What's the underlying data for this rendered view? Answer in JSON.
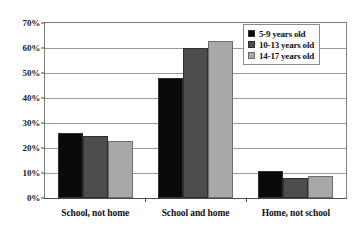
{
  "chart_data": {
    "type": "bar",
    "title": "",
    "xlabel": "",
    "ylabel": "",
    "categories": [
      "School, not home",
      "School and home",
      "Home, not school"
    ],
    "series": [
      {
        "name": "5-9 years old",
        "color": "#0a0a0a",
        "values": [
          26,
          48,
          11
        ]
      },
      {
        "name": "10-13 years old",
        "color": "#4d4d4d",
        "values": [
          25,
          60,
          8
        ]
      },
      {
        "name": "14-17 years old",
        "color": "#a8a8a8",
        "values": [
          23,
          63,
          9
        ]
      }
    ],
    "ylim": [
      0,
      70
    ],
    "ytick_step": 10,
    "ytick_labels": [
      "0%",
      "10%",
      "20%",
      "30%",
      "40%",
      "50%",
      "60%",
      "70%"
    ],
    "ytick_values": [
      0,
      10,
      20,
      30,
      40,
      50,
      60,
      70
    ],
    "grid": true,
    "legend_position": "top-right"
  },
  "legend": {
    "items": [
      {
        "label": "5-9 years old"
      },
      {
        "label": "10-13 years old"
      },
      {
        "label": "14-17 years old"
      }
    ]
  }
}
